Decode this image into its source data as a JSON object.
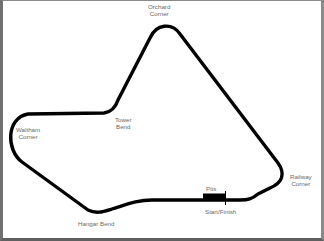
{
  "map": {
    "title": "Circuit layout",
    "track_color": "#000000",
    "label_color": "#6a6a6a",
    "border_color": "#707070",
    "background": "#ffffff"
  },
  "labels": {
    "orchard": {
      "line1": "Orchard",
      "line2": "Corner"
    },
    "tower": {
      "line1": "Tower",
      "line2": "Bend"
    },
    "waltham": {
      "line1": "Waltham",
      "line2": "Corner"
    },
    "railway": {
      "line1": "Railway",
      "line2": "Corner"
    },
    "hangar": {
      "line1": "Hangar Bend"
    },
    "pits": {
      "line1": "Pits"
    },
    "start_finish": {
      "line1": "Start/Finish"
    }
  }
}
